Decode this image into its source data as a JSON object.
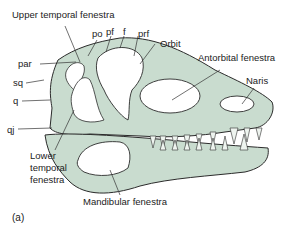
{
  "diagram": {
    "panel_label": "(a)",
    "colors": {
      "bone": "#c9dccf",
      "outline": "#2b2b2b",
      "fenestra": "#ffffff",
      "leader": "#333333"
    },
    "labels": {
      "upper_temporal_fenestra": "Upper temporal fenestra",
      "po": "po",
      "pf": "pf",
      "f": "f",
      "prf": "prf",
      "orbit": "Orbit",
      "antorbital_fenestra": "Antorbital fenestra",
      "naris": "Naris",
      "par": "par",
      "sq": "sq",
      "q": "q",
      "qj": "qj",
      "lower_temporal_fenestra_1": "Lower",
      "lower_temporal_fenestra_2": "temporal",
      "lower_temporal_fenestra_3": "fenestra",
      "mandibular_fenestra": "Mandibular fenestra"
    }
  }
}
